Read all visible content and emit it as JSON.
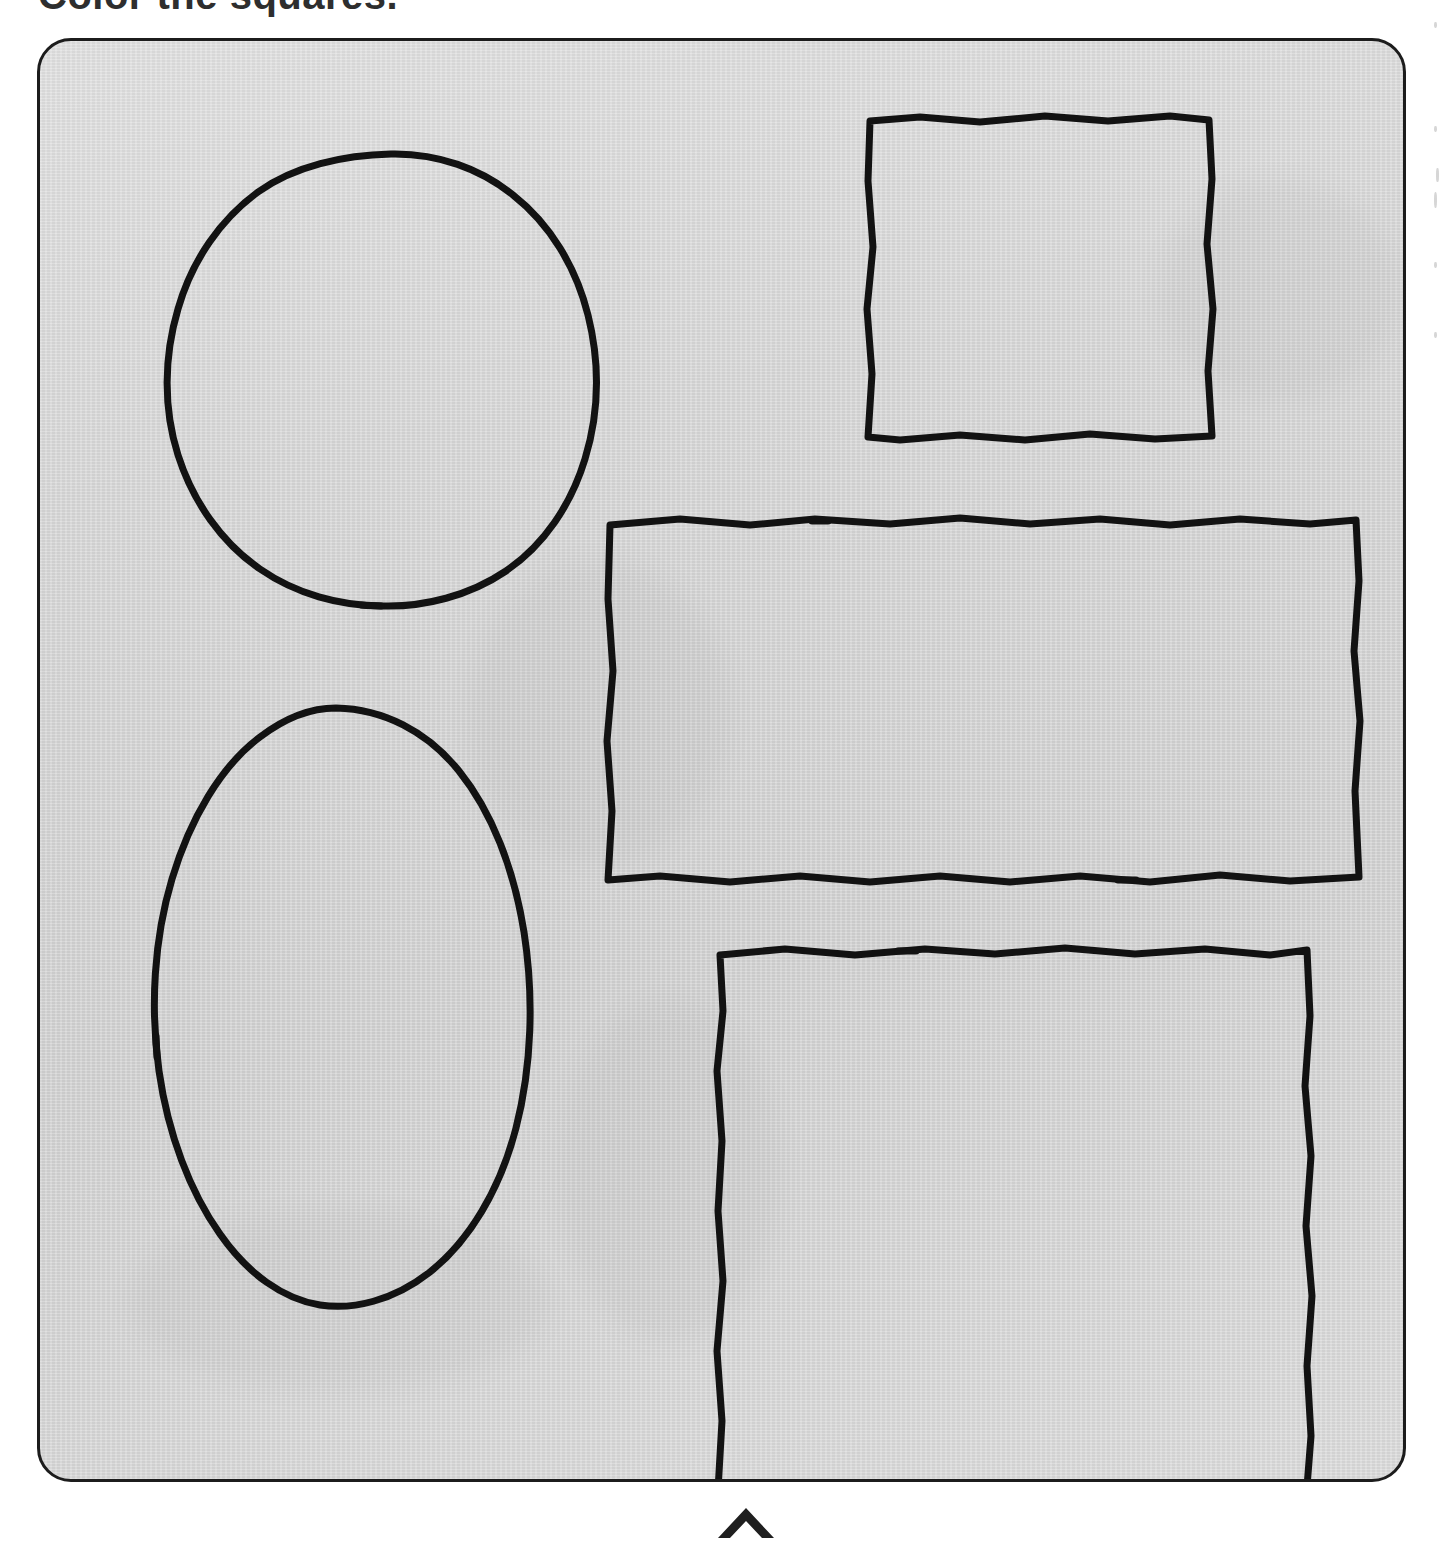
{
  "page": {
    "title": "Color the squares.",
    "title_note": "top of text cropped by scan edge",
    "background_color": "#ffffff"
  },
  "panel": {
    "name": "shape-panel",
    "fill_color": "#d5d5d5",
    "border_color": "#1c1c1c",
    "corner_radius_px": 34
  },
  "shapes": [
    {
      "id": "circle",
      "label": "circle",
      "kind": "circle",
      "fill_color": "#ffffff",
      "outline_color": "#121212",
      "position": "top-left",
      "has_stroke_gap": true,
      "gap_location": "bottom"
    },
    {
      "id": "oval",
      "label": "oval",
      "kind": "ellipse",
      "fill_color": "#ffffff",
      "outline_color": "#121212",
      "position": "bottom-left",
      "has_stroke_gap": true,
      "gap_location": "left"
    },
    {
      "id": "square-small",
      "label": "square",
      "kind": "square",
      "fill_color": "#ffffff",
      "outline_color": "#121212",
      "position": "top-right",
      "has_stroke_gap": false,
      "gap_location": ""
    },
    {
      "id": "rect-wide",
      "label": "rectangle",
      "kind": "rectangle",
      "fill_color": "#ffffff",
      "outline_color": "#121212",
      "position": "middle-right",
      "has_stroke_gap": true,
      "gap_location": "top and bottom"
    },
    {
      "id": "square-large",
      "label": "square",
      "kind": "square",
      "fill_color": "#ffffff",
      "outline_color": "#121212",
      "position": "bottom-right",
      "has_stroke_gap": true,
      "gap_location": "top and bottom"
    }
  ],
  "marker": {
    "name": "page-marker-arrow",
    "glyph": "up-chevron",
    "color": "#1f1f1f"
  }
}
